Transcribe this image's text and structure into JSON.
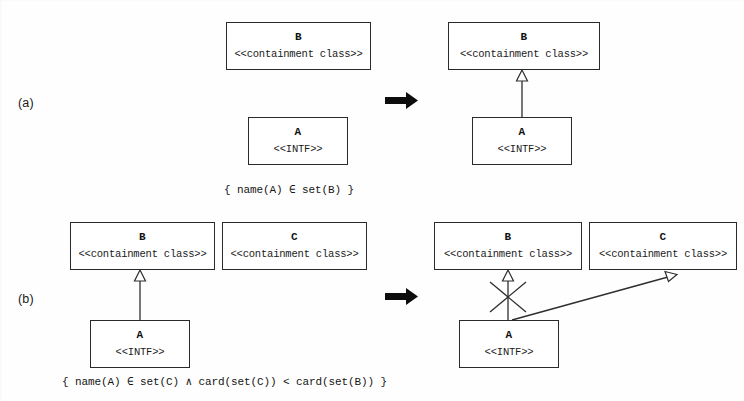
{
  "figure": {
    "panels": [
      {
        "id": "a",
        "label": "(a)",
        "constraint": "{ name(A) ∈ set(B) }",
        "transform_arrow": "right-arrow",
        "before": {
          "boxes": [
            {
              "name": "B",
              "stereotype": "<<containment class>>"
            },
            {
              "name": "A",
              "stereotype": "<<INTF>>"
            }
          ],
          "relations": []
        },
        "after": {
          "boxes": [
            {
              "name": "B",
              "stereotype": "<<containment class>>"
            },
            {
              "name": "A",
              "stereotype": "<<INTF>>"
            }
          ],
          "relations": [
            {
              "kind": "generalization",
              "from": "A",
              "to": "B",
              "crossed_out": false
            }
          ]
        }
      },
      {
        "id": "b",
        "label": "(b)",
        "constraint": "{ name(A) ∈ set(C) ∧ card(set(C)) < card(set(B)) }",
        "transform_arrow": "right-arrow",
        "before": {
          "boxes": [
            {
              "name": "B",
              "stereotype": "<<containment class>>"
            },
            {
              "name": "C",
              "stereotype": "<<containment class>>"
            },
            {
              "name": "A",
              "stereotype": "<<INTF>>"
            }
          ],
          "relations": [
            {
              "kind": "generalization",
              "from": "A",
              "to": "B",
              "crossed_out": false
            }
          ]
        },
        "after": {
          "boxes": [
            {
              "name": "B",
              "stereotype": "<<containment class>>"
            },
            {
              "name": "C",
              "stereotype": "<<containment class>>"
            },
            {
              "name": "A",
              "stereotype": "<<INTF>>"
            }
          ],
          "relations": [
            {
              "kind": "generalization",
              "from": "A",
              "to": "B",
              "crossed_out": true
            },
            {
              "kind": "generalization",
              "from": "A",
              "to": "C",
              "crossed_out": false
            }
          ]
        }
      }
    ]
  },
  "colors": {
    "ink": "#2a2a2a",
    "paper": "#fefefe",
    "arrow": "#0d0d0d"
  }
}
